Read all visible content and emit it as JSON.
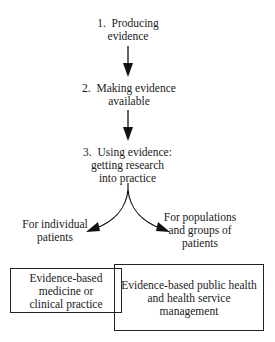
{
  "diagram": {
    "steps": [
      {
        "number": "1.",
        "lines": [
          "Producing",
          "evidence"
        ]
      },
      {
        "number": "2.",
        "lines": [
          "Making evidence",
          "available"
        ]
      },
      {
        "number": "3.",
        "lines": [
          "Using evidence:",
          "getting research",
          "into practice"
        ]
      }
    ],
    "branches": [
      {
        "lines": [
          "For individual",
          "patients"
        ]
      },
      {
        "lines": [
          "For populations",
          "and groups of",
          "patients"
        ]
      }
    ],
    "outcomes": [
      {
        "lines": [
          "Evidence-based",
          "medicine or",
          "clinical practice"
        ]
      },
      {
        "lines": [
          "Evidence-based public health",
          "and health service",
          "management"
        ]
      }
    ],
    "colors": {
      "stroke": "#222222",
      "background": "#ffffff"
    }
  }
}
